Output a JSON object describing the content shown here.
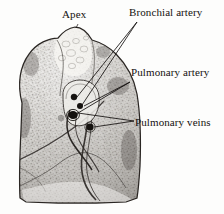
{
  "figure": {
    "type": "anatomical-engraving",
    "background_color": "#fdfdfc",
    "ink_color": "#14110f",
    "width": 224,
    "height": 214
  },
  "labels": {
    "apex": "Apex",
    "bronchial_artery": "Bronchial artery",
    "pulmonary_artery": "Pulmonary artery",
    "pulmonary_veins": "Pulmonary veins"
  },
  "structures": [
    {
      "name": "apex",
      "label": "Apex"
    },
    {
      "name": "bronchial-artery",
      "label": "Bronchial artery"
    },
    {
      "name": "pulmonary-artery",
      "label": "Pulmonary artery"
    },
    {
      "name": "pulmonary-veins",
      "label": "Pulmonary veins"
    }
  ]
}
